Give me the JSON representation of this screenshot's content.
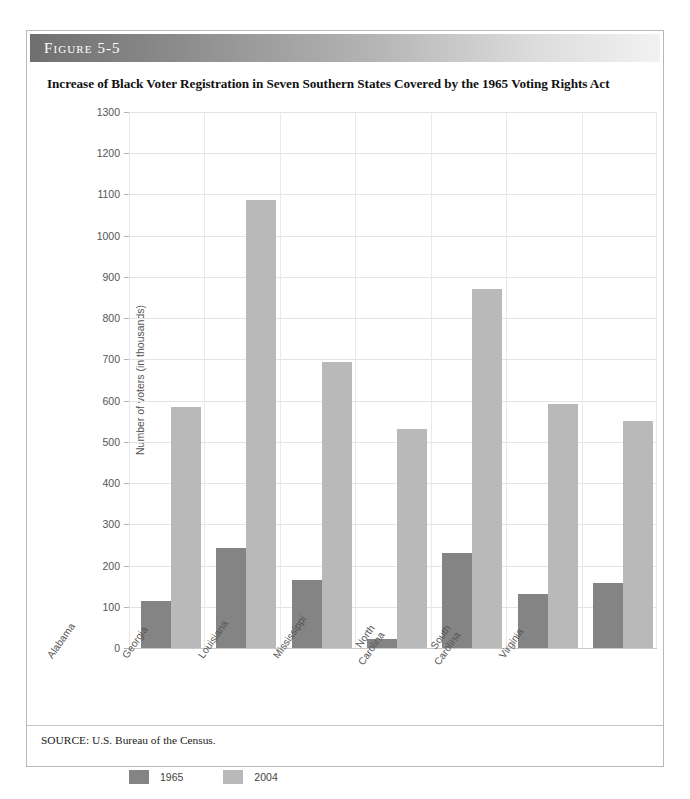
{
  "figure": {
    "label": "Figure 5-5",
    "title": "Increase of Black Voter Registration in Seven Southern States Covered by the 1965 Voting Rights Act",
    "source_note": "SOURCE: U.S. Bureau of the Census."
  },
  "legend": {
    "items": [
      {
        "label": "1965",
        "color": "#848484"
      },
      {
        "label": "2004",
        "color": "#b9b9b9"
      }
    ]
  },
  "colors": {
    "series_1965": "#848484",
    "series_2004": "#b9b9b9",
    "gridline": "#e4e4e4",
    "text": "#555555",
    "header_dark": "#6f6f6f",
    "header_light": "#f2f2f2"
  },
  "chart_data": {
    "type": "bar",
    "title": "Increase of Black Voter Registration in Seven Southern States Covered by the 1965 Voting Rights Act",
    "xlabel": "",
    "ylabel": "Number of voters (in thousands)",
    "ylim": [
      0,
      1300
    ],
    "ytick_step": 100,
    "yticks": [
      0,
      100,
      200,
      300,
      400,
      500,
      600,
      700,
      800,
      900,
      1000,
      1100,
      1200,
      1300
    ],
    "ytick_labels": [
      "0",
      "100",
      "200",
      "300",
      "400",
      "500",
      "600",
      "700",
      "800",
      "900",
      "1000",
      "1100",
      "1200",
      "1300"
    ],
    "grid": true,
    "legend_position": "bottom-left",
    "categories": [
      "Alabama",
      "Georgia",
      "Louisiana",
      "Mississippi",
      "North Carolina",
      "South Carolina",
      "Virginia"
    ],
    "category_lines": [
      [
        "Alabama"
      ],
      [
        "Georgia"
      ],
      [
        "Louisiana"
      ],
      [
        "Mississippi"
      ],
      [
        "North",
        "Carolina"
      ],
      [
        "South",
        "Carolina"
      ],
      [
        "Virginia"
      ]
    ],
    "series": [
      {
        "name": "1965",
        "color": "#848484",
        "values": [
          113,
          243,
          164,
          22,
          231,
          132,
          157
        ]
      },
      {
        "name": "2004",
        "color": "#b9b9b9",
        "values": [
          585,
          1087,
          693,
          530,
          870,
          593,
          551
        ]
      }
    ]
  }
}
